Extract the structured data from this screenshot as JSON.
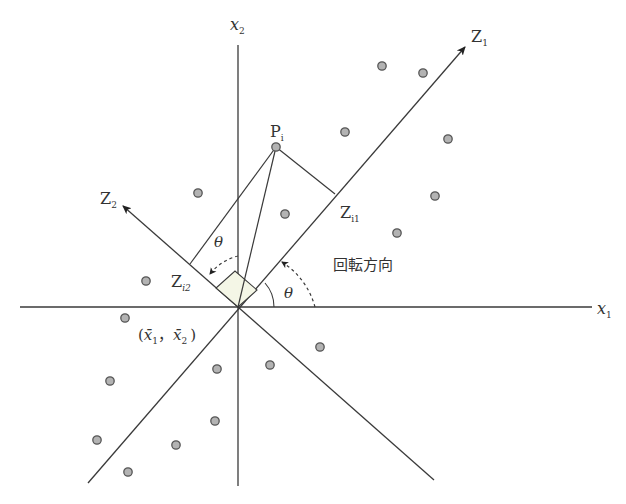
{
  "diagram": {
    "type": "principal-component-rotation",
    "colors": {
      "line": "#3a3a3a",
      "point_fill": "#b3b3b3",
      "point_stroke": "#555555",
      "right_angle_fill": "#f4f6e6",
      "text": "#333333"
    },
    "labels": {
      "x1_axis": {
        "base": "x",
        "sub": "1"
      },
      "x2_axis": {
        "base": "x",
        "sub": "2"
      },
      "z1_axis": {
        "base": "Z",
        "sub": "1"
      },
      "z2_axis": {
        "base": "Z",
        "sub": "2"
      },
      "point_pi": {
        "base": "P",
        "sub": "i"
      },
      "proj_zi1": {
        "base": "Z",
        "sub": "i1"
      },
      "proj_zi2": {
        "base": "Z",
        "sub": "i2"
      },
      "theta_upper": "θ",
      "theta_lower": "θ",
      "rotation_direction": "回転方向",
      "mean_point": {
        "open": "(",
        "x1": "x̄",
        "x1_sub": "1",
        "sep": "，",
        "x2": "x̄",
        "x2_sub": "2",
        "close": ")"
      }
    },
    "origin": [
      238,
      307
    ],
    "rotation_angle_deg": 37,
    "point_pi": [
      276,
      147
    ],
    "data_points": [
      [
        198,
        193
      ],
      [
        285,
        214
      ],
      [
        345,
        132
      ],
      [
        382,
        66
      ],
      [
        423,
        73
      ],
      [
        448,
        139
      ],
      [
        435,
        196
      ],
      [
        397,
        233
      ],
      [
        146,
        281
      ],
      [
        125,
        318
      ],
      [
        270,
        365
      ],
      [
        320,
        347
      ],
      [
        110,
        381
      ],
      [
        217,
        369
      ],
      [
        97,
        440
      ],
      [
        176,
        445
      ],
      [
        215,
        421
      ],
      [
        128,
        472
      ]
    ]
  }
}
